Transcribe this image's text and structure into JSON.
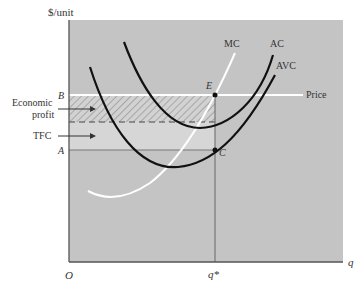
{
  "diagram": {
    "y_axis_label": "$/unit",
    "x_axis_label": "q",
    "origin_label": "O",
    "q_star_label": "q*",
    "price_label": "Price",
    "point_labels": {
      "B": "B",
      "A": "A",
      "E": "E",
      "C": "C"
    },
    "curve_labels": {
      "mc": "MC",
      "ac": "AC",
      "avc": "AVC"
    },
    "annotations": {
      "economic_profit_line1": "Economic",
      "economic_profit_line2": "profit",
      "tfc": "TFC"
    },
    "colors": {
      "background": "#c4c4c4",
      "tfc_region": "#d6d6d6",
      "hatch": "#7a7a7a",
      "price_line": "#ffffff",
      "mc_curve": "#ffffff",
      "ac_curve": "#111111",
      "avc_curve": "#111111"
    }
  }
}
